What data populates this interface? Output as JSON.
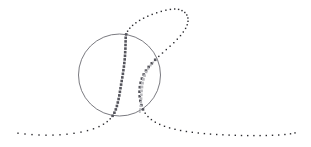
{
  "figure": {
    "background_color": "#ffffff",
    "width": 311,
    "height": 147
  },
  "chart_data": {
    "type": "scatter",
    "xlabel": "",
    "ylabel": "",
    "xlim": [
      0,
      311
    ],
    "ylim": [
      0,
      147
    ],
    "grid": false,
    "legend": "none",
    "axes_visible": false,
    "tick_labels": [],
    "annotations": [],
    "shapes": [
      {
        "name": "circle-outline",
        "type": "circle",
        "cx": 119.5,
        "cy": 75,
        "r": 41,
        "stroke": "#6b6b72",
        "stroke_width": 0.9,
        "fill": "none"
      }
    ],
    "series": [
      {
        "name": "main-trajectory",
        "marker": "square",
        "marker_size_min": 1.4,
        "marker_size_max": 2.6,
        "color_dark": "#2a2a2e",
        "color_mid": "#55555c",
        "points": [
          [
            18,
            133.2
          ],
          [
            25,
            134.0
          ],
          [
            32,
            134.6
          ],
          [
            39,
            135.0
          ],
          [
            46,
            135.2
          ],
          [
            53,
            135.1
          ],
          [
            60,
            134.8
          ],
          [
            67,
            134.2
          ],
          [
            74,
            133.3
          ],
          [
            81,
            132.1
          ],
          [
            87.5,
            130.6
          ],
          [
            93.5,
            128.8
          ],
          [
            99,
            126.6
          ],
          [
            103.5,
            124.2
          ],
          [
            107.2,
            121.6
          ],
          [
            110.2,
            118.8
          ],
          [
            112.6,
            115.8
          ],
          [
            114.4,
            112.7
          ],
          [
            115.8,
            109.4
          ],
          [
            116.9,
            106.0
          ],
          [
            117.8,
            102.5
          ],
          [
            118.6,
            99.0
          ],
          [
            119.3,
            95.4
          ],
          [
            119.9,
            91.8
          ],
          [
            120.5,
            88.2
          ],
          [
            121.1,
            84.6
          ],
          [
            121.7,
            81.0
          ],
          [
            122.3,
            77.4
          ],
          [
            122.9,
            73.8
          ],
          [
            123.4,
            70.2
          ],
          [
            123.9,
            66.6
          ],
          [
            124.3,
            63.0
          ],
          [
            124.7,
            59.4
          ],
          [
            125.0,
            55.8
          ],
          [
            125.2,
            52.2
          ],
          [
            125.4,
            48.6
          ],
          [
            125.5,
            45.0
          ],
          [
            125.6,
            41.4
          ],
          [
            125.7,
            37.8
          ],
          [
            126.2,
            34.4
          ],
          [
            127.6,
            31.2
          ],
          [
            129.8,
            28.2
          ],
          [
            132.6,
            25.4
          ],
          [
            135.9,
            22.8
          ],
          [
            139.6,
            20.4
          ],
          [
            143.6,
            18.2
          ],
          [
            147.8,
            16.2
          ],
          [
            152.2,
            14.4
          ],
          [
            156.7,
            12.8
          ],
          [
            161.3,
            11.4
          ],
          [
            165.9,
            10.2
          ],
          [
            170.4,
            9.4
          ],
          [
            174.7,
            9.0
          ],
          [
            178.6,
            9.4
          ],
          [
            182.0,
            10.6
          ],
          [
            184.8,
            12.5
          ],
          [
            186.8,
            15.0
          ],
          [
            187.9,
            18.0
          ],
          [
            188.0,
            21.3
          ],
          [
            187.2,
            24.8
          ],
          [
            185.6,
            28.4
          ],
          [
            183.3,
            32.0
          ],
          [
            180.5,
            35.6
          ],
          [
            177.3,
            39.2
          ],
          [
            173.8,
            42.7
          ],
          [
            170.1,
            46.2
          ],
          [
            166.3,
            49.6
          ],
          [
            162.5,
            53.0
          ],
          [
            158.8,
            56.4
          ],
          [
            155.2,
            59.8
          ],
          [
            151.8,
            63.3
          ],
          [
            148.7,
            66.9
          ],
          [
            146.0,
            70.6
          ],
          [
            143.7,
            74.5
          ],
          [
            141.9,
            78.6
          ],
          [
            140.6,
            82.8
          ],
          [
            139.8,
            87.2
          ],
          [
            139.5,
            91.7
          ],
          [
            139.7,
            96.3
          ],
          [
            140.3,
            100.8
          ],
          [
            141.4,
            105.2
          ],
          [
            143.0,
            109.4
          ],
          [
            145.2,
            113.2
          ],
          [
            148.0,
            116.6
          ],
          [
            151.4,
            119.6
          ],
          [
            155.3,
            122.2
          ],
          [
            159.7,
            124.4
          ],
          [
            164.5,
            126.3
          ],
          [
            169.6,
            127.9
          ],
          [
            175.0,
            129.3
          ],
          [
            180.6,
            130.5
          ],
          [
            186.4,
            131.5
          ],
          [
            192.3,
            132.3
          ],
          [
            198.3,
            133.0
          ],
          [
            204.4,
            133.6
          ],
          [
            210.5,
            134.1
          ],
          [
            216.7,
            134.5
          ],
          [
            222.9,
            134.8
          ],
          [
            229.1,
            135.1
          ],
          [
            235.3,
            135.3
          ],
          [
            241.5,
            135.5
          ],
          [
            247.7,
            135.6
          ],
          [
            253.9,
            135.6
          ],
          [
            260.1,
            135.6
          ],
          [
            266.3,
            135.5
          ],
          [
            272.5,
            135.3
          ],
          [
            278.7,
            135.0
          ],
          [
            284.9,
            134.5
          ],
          [
            290.5,
            133.8
          ],
          [
            295.0,
            132.9
          ]
        ]
      },
      {
        "name": "secondary-branch",
        "marker": "square",
        "marker_size_min": 1.8,
        "marker_size_max": 2.8,
        "color_light": "#b9b9bd",
        "points": [
          [
            153.2,
            62.4
          ],
          [
            150.6,
            65.4
          ],
          [
            148.2,
            68.6
          ],
          [
            146.2,
            72.0
          ],
          [
            144.6,
            75.6
          ],
          [
            143.4,
            79.3
          ],
          [
            142.5,
            83.1
          ],
          [
            141.9,
            87.0
          ],
          [
            141.5,
            90.9
          ],
          [
            141.3,
            94.8
          ],
          [
            141.1,
            98.6
          ],
          [
            140.9,
            102.3
          ],
          [
            140.6,
            105.9
          ],
          [
            140.2,
            109.2
          ],
          [
            139.8,
            112.0
          ]
        ]
      }
    ]
  }
}
